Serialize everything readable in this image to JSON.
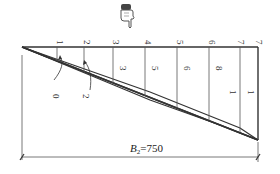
{
  "figure": {
    "top_labels": [
      "1",
      "2",
      "3",
      "4",
      "5",
      "6",
      "7",
      "7"
    ],
    "inner_labels": [
      "3",
      "5",
      "6",
      "8",
      "1",
      "1"
    ],
    "lower_labels": [
      "0",
      "2"
    ],
    "dimension": {
      "symbol": "B",
      "subscript": "2",
      "equals": "=750"
    },
    "icons": [
      "pointing-hand-icon"
    ]
  },
  "colors": {
    "line": "#333333",
    "thin_line": "#555555",
    "background": "#ffffff"
  }
}
